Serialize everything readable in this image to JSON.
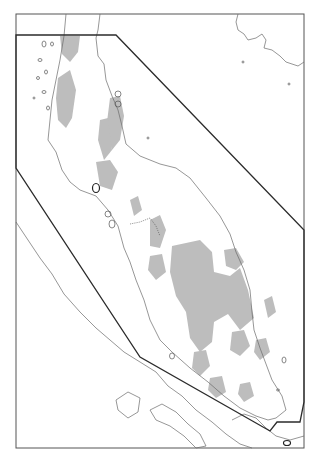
{
  "map": {
    "title": "",
    "colors": {
      "background": "#ffffff",
      "frame": "#555555",
      "coastline": "#6a6a6a",
      "relief": "#bdbdbd",
      "boundary": "#2b2b2b"
    },
    "frame": {
      "x": 16,
      "y": 14,
      "width": 288,
      "height": 434
    },
    "boundary_polygon": [
      [
        16,
        35
      ],
      [
        116,
        35
      ],
      [
        304,
        230
      ],
      [
        304,
        402
      ],
      [
        300,
        422
      ],
      [
        277,
        422
      ],
      [
        270,
        431
      ],
      [
        140,
        357
      ],
      [
        16,
        168
      ]
    ],
    "layers": [
      "frame",
      "coastline",
      "islands",
      "relief-shading",
      "national-border",
      "study-area-boundary"
    ]
  }
}
